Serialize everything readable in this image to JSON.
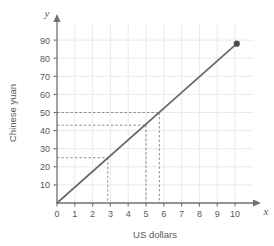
{
  "chart_data": {
    "type": "line",
    "title": "",
    "xlabel": "US dollars",
    "ylabel": "Chinese yuan",
    "xlim": [
      0,
      10.6
    ],
    "ylim": [
      0,
      96
    ],
    "grid": true,
    "legend": null,
    "x_ticks": [
      0,
      1,
      2,
      3,
      4,
      5,
      6,
      7,
      8,
      9,
      10
    ],
    "x_tick_labels": [
      "0",
      "1",
      "2",
      "3",
      "4",
      "5",
      "6",
      "7",
      "8",
      "9",
      "10"
    ],
    "y_ticks": [
      10,
      20,
      30,
      40,
      50,
      60,
      70,
      80,
      90
    ],
    "y_tick_labels": [
      "10",
      "20",
      "30",
      "40",
      "50",
      "60",
      "70",
      "80",
      "90"
    ],
    "axis_letters": {
      "x": "x",
      "y": "y"
    },
    "series": [
      {
        "name": "US dollars to Chinese yuan",
        "x": [
          0,
          10.1
        ],
        "values": [
          0,
          88
        ],
        "color": "#6a6a6c",
        "endpoint_marker": {
          "x": 10.1,
          "y": 88
        }
      }
    ],
    "slope": 8.71,
    "annotations": [
      {
        "name": "guide-25-yuan",
        "y": 25,
        "x": 2.85,
        "style": "dashed"
      },
      {
        "name": "guide-43-yuan",
        "y": 43,
        "x": 5,
        "style": "dashed"
      },
      {
        "name": "guide-50-yuan",
        "y": 50,
        "x": 5.75,
        "style": "dashed"
      }
    ]
  },
  "labels": {
    "x_axis_title": "US dollars",
    "y_axis_title": "Chinese yuan",
    "x_axis_letter": "x",
    "y_axis_letter": "y",
    "ticks_x": [
      "0",
      "1",
      "2",
      "3",
      "4",
      "5",
      "6",
      "7",
      "8",
      "9",
      "10"
    ],
    "ticks_y": [
      "10",
      "20",
      "30",
      "40",
      "50",
      "60",
      "70",
      "80",
      "90"
    ]
  },
  "colors": {
    "background": "#ffffff",
    "grid": "#e9eaec",
    "axis": "#6f7072",
    "line": "#6a6a6c",
    "point": "#4d4d4f",
    "guide": "#8c8c8e",
    "text": "#58595b"
  }
}
